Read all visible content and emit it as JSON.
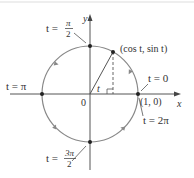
{
  "diagram": {
    "type": "unit-circle-parametrization",
    "axes": {
      "x_label": "x",
      "y_label": "y",
      "origin_label": "0"
    },
    "point": {
      "label": "(cos t, sin t)"
    },
    "angle_label": "t",
    "intercept_label": "(1, 0)",
    "annotations": [
      {
        "id": "t0",
        "label": "t = 0"
      },
      {
        "id": "t2pi",
        "label": "t = 2π"
      },
      {
        "id": "tpi",
        "label": "t = π"
      },
      {
        "id": "tpi2",
        "t": "t =",
        "num": "π",
        "den": "2"
      },
      {
        "id": "t3pi2",
        "t": "t =",
        "num": "3π",
        "den": "2"
      }
    ],
    "colors": {
      "circle": "#888888",
      "axes": "#555555",
      "text": "#333333",
      "points": "#222222"
    }
  }
}
